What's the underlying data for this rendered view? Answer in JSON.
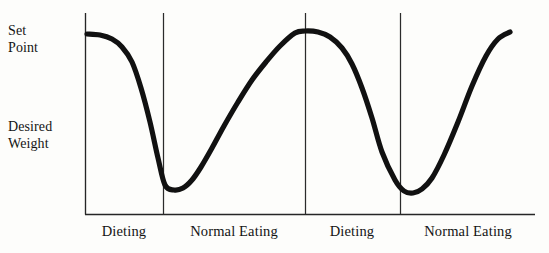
{
  "figure": {
    "background_color": "#fdfdfb",
    "ink_color": "#111111",
    "axis_color": "#262626"
  },
  "y_axis": {
    "labels": [
      {
        "id": "set-point",
        "line1": "Set",
        "line2": "Point"
      },
      {
        "id": "desired-weight",
        "line1": "Desired",
        "line2": "Weight"
      }
    ]
  },
  "x_axis": {
    "labels": [
      {
        "id": "phase-1",
        "text": "Dieting"
      },
      {
        "id": "phase-2",
        "text": "Normal Eating"
      },
      {
        "id": "phase-3",
        "text": "Dieting"
      },
      {
        "id": "phase-4",
        "text": "Normal Eating"
      }
    ]
  },
  "chart_data": {
    "type": "line",
    "title": "",
    "subtitle": "",
    "xlabel": "",
    "ylabel": "",
    "grid": false,
    "legend": null,
    "annotations": [],
    "y_tick_labels": [
      "Set Point",
      "Desired Weight"
    ],
    "y_tick_positions_px": [
      34,
      134
    ],
    "x_tick_labels": [
      "Dieting",
      "Normal Eating",
      "Dieting",
      "Normal Eating"
    ],
    "x_phase_boundaries_px": [
      85,
      163,
      305,
      400,
      535
    ],
    "axis_geometry": {
      "left_axis_x": 85,
      "baseline_y": 214,
      "axis_top_y": 13,
      "baseline_x_end": 535,
      "divider_x": [
        163,
        305,
        400
      ]
    },
    "series": [
      {
        "name": "Body weight over diet cycles",
        "color": "#111111",
        "line_width_px": 5.2,
        "x": [
          87,
          100,
          112,
          122,
          132,
          141,
          150,
          158,
          165,
          174,
          183,
          192,
          201,
          212,
          224,
          238,
          252,
          266,
          280,
          295,
          305,
          318,
          330,
          342,
          352,
          362,
          372,
          382,
          395,
          404,
          413,
          422,
          432,
          444,
          458,
          472,
          486,
          498,
          510
        ],
        "y": [
          34,
          35,
          39,
          47,
          62,
          88,
          122,
          158,
          185,
          190,
          188,
          180,
          167,
          148,
          126,
          102,
          80,
          62,
          46,
          33,
          31,
          32,
          37,
          48,
          64,
          88,
          118,
          152,
          180,
          191,
          193,
          189,
          178,
          155,
          122,
          86,
          56,
          39,
          32
        ],
        "description": "Weight starts at the Set Point, plunges toward Desired Weight during dieting, rebounds to the Set Point during normal eating, then repeats the cycle."
      }
    ]
  }
}
